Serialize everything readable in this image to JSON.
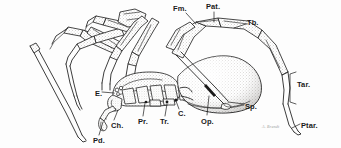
{
  "figure": {
    "background_color": "#fdfdfd",
    "ink_color": "#1a1a1a",
    "stipple_color": "#8a8782",
    "signature": "A. Brandt"
  },
  "labels": [
    {
      "id": "fm",
      "text": "Fm.",
      "name": "label-femur",
      "x": 173,
      "y": 5,
      "part": "femur"
    },
    {
      "id": "pat",
      "text": "Pat.",
      "name": "label-patella",
      "x": 206,
      "y": 3,
      "part": "patella"
    },
    {
      "id": "tb",
      "text": "Tb.",
      "name": "label-tibia",
      "x": 247,
      "y": 19,
      "part": "tibia"
    },
    {
      "id": "tar",
      "text": "Tar.",
      "name": "label-tarsus",
      "x": 297,
      "y": 81,
      "part": "tarsus"
    },
    {
      "id": "ptar",
      "text": "Ptar.",
      "name": "label-pretarsus",
      "x": 301,
      "y": 122,
      "part": "pretarsus"
    },
    {
      "id": "sp",
      "text": "Sp.",
      "name": "label-spinnerets",
      "x": 245,
      "y": 103,
      "part": "spinnerets"
    },
    {
      "id": "op",
      "text": "Op.",
      "name": "label-opisthosoma",
      "x": 201,
      "y": 118,
      "part": "opisthosoma"
    },
    {
      "id": "c",
      "text": "C.",
      "name": "label-coxa",
      "x": 178,
      "y": 110,
      "part": "coxa"
    },
    {
      "id": "tr",
      "text": "Tr.",
      "name": "label-trochanter",
      "x": 160,
      "y": 118,
      "part": "trochanter"
    },
    {
      "id": "pr",
      "text": "Pr.",
      "name": "label-prosoma",
      "x": 138,
      "y": 118,
      "part": "prosoma"
    },
    {
      "id": "ch",
      "text": "Ch.",
      "name": "label-chelicera",
      "x": 111,
      "y": 122,
      "part": "chelicera"
    },
    {
      "id": "pd",
      "text": "Pd.",
      "name": "label-pedipalp",
      "x": 93,
      "y": 137,
      "part": "pedipalp"
    },
    {
      "id": "e",
      "text": "E.",
      "name": "label-eyes",
      "x": 95,
      "y": 90,
      "part": "eyes"
    }
  ],
  "leaders": [
    {
      "name": "leader-fm",
      "from": "fm",
      "d": "M186,13 L196,24"
    },
    {
      "name": "leader-pat",
      "from": "pat",
      "d": "M214,12 L214,22"
    },
    {
      "name": "leader-tb",
      "from": "tb",
      "d": "M246,24 L234,28"
    },
    {
      "name": "leader-sp",
      "from": "sp",
      "d": "M244,104 L228,102"
    },
    {
      "name": "leader-op",
      "from": "op",
      "d": "M207,115 L209,96"
    },
    {
      "name": "leader-c",
      "from": "c",
      "d": "M179,109 L176,101"
    },
    {
      "name": "leader-tr",
      "from": "tr",
      "d": "M165,116 L167,104"
    },
    {
      "name": "leader-pr",
      "from": "pr",
      "d": "M143,116 L145,103"
    },
    {
      "name": "leader-ch",
      "from": "ch",
      "d": "M114,120 L118,110"
    },
    {
      "name": "leader-pd",
      "from": "pd",
      "d": "M99,135 L103,122"
    },
    {
      "name": "leader-e",
      "from": "e",
      "d": "M102,92 L114,93"
    },
    {
      "name": "leader-ptar",
      "from": "ptar",
      "d": "M300,124 L292,128"
    }
  ],
  "bracket": {
    "name": "tarsus-bracket",
    "d": "M296,72 L290,74 L290,102 L296,104"
  }
}
